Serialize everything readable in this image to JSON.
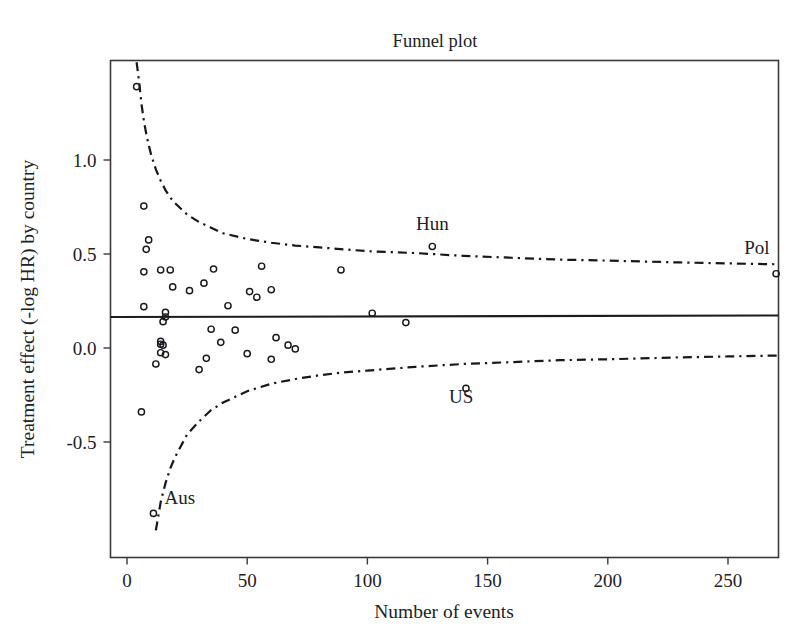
{
  "chart_data": {
    "type": "scatter",
    "title": "Funnel plot",
    "xlabel": "Number of events",
    "ylabel": "Treatment effect (-log HR) by country",
    "xlim": [
      -10,
      273
    ],
    "ylim": [
      -0.97,
      1.5
    ],
    "xticks": [
      0,
      50,
      100,
      150,
      200,
      250
    ],
    "xticklabels": [
      "0",
      "50",
      "100",
      "150",
      "200",
      "250"
    ],
    "yticks": [
      1.0,
      0.5,
      0.0,
      -0.5
    ],
    "yticklabels": [
      "1.0",
      "0.5",
      "0.0",
      "-0.5"
    ],
    "grid": false,
    "legend": null,
    "reference_line": {
      "type": "horizontal",
      "value": 0.17,
      "style": "solid",
      "label": "pooled treatment effect"
    },
    "funnel_limits": {
      "style": "dash-dot",
      "center": 0.17,
      "upper": [
        [
          4,
          1.52
        ],
        [
          5,
          1.42
        ],
        [
          6,
          1.3
        ],
        [
          7,
          1.21
        ],
        [
          8,
          1.14
        ],
        [
          9,
          1.08
        ],
        [
          10,
          1.03
        ],
        [
          12,
          0.95
        ],
        [
          14,
          0.89
        ],
        [
          16,
          0.84
        ],
        [
          18,
          0.8
        ],
        [
          20,
          0.77
        ],
        [
          25,
          0.71
        ],
        [
          30,
          0.67
        ],
        [
          35,
          0.64
        ],
        [
          40,
          0.61
        ],
        [
          50,
          0.58
        ],
        [
          60,
          0.56
        ],
        [
          70,
          0.545
        ],
        [
          80,
          0.535
        ],
        [
          90,
          0.525
        ],
        [
          100,
          0.515
        ],
        [
          120,
          0.505
        ],
        [
          140,
          0.49
        ],
        [
          160,
          0.48
        ],
        [
          180,
          0.47
        ],
        [
          200,
          0.465
        ],
        [
          230,
          0.455
        ],
        [
          250,
          0.45
        ],
        [
          271,
          0.445
        ]
      ],
      "lower": [
        [
          12,
          -0.97
        ],
        [
          14,
          -0.82
        ],
        [
          16,
          -0.72
        ],
        [
          18,
          -0.64
        ],
        [
          20,
          -0.58
        ],
        [
          25,
          -0.46
        ],
        [
          30,
          -0.39
        ],
        [
          35,
          -0.33
        ],
        [
          40,
          -0.29
        ],
        [
          50,
          -0.23
        ],
        [
          60,
          -0.19
        ],
        [
          70,
          -0.165
        ],
        [
          80,
          -0.145
        ],
        [
          90,
          -0.13
        ],
        [
          100,
          -0.12
        ],
        [
          120,
          -0.1
        ],
        [
          140,
          -0.085
        ],
        [
          160,
          -0.075
        ],
        [
          180,
          -0.065
        ],
        [
          200,
          -0.06
        ],
        [
          230,
          -0.05
        ],
        [
          250,
          -0.045
        ],
        [
          271,
          -0.04
        ]
      ]
    },
    "points": [
      {
        "x": 4,
        "y": 1.39
      },
      {
        "x": 7,
        "y": 0.755
      },
      {
        "x": 9,
        "y": 0.575
      },
      {
        "x": 8,
        "y": 0.525
      },
      {
        "x": 14,
        "y": 0.415
      },
      {
        "x": 18,
        "y": 0.415
      },
      {
        "x": 7,
        "y": 0.405
      },
      {
        "x": 36,
        "y": 0.42
      },
      {
        "x": 56,
        "y": 0.435
      },
      {
        "x": 89,
        "y": 0.415
      },
      {
        "x": 127,
        "y": 0.54
      },
      {
        "x": 270,
        "y": 0.395
      },
      {
        "x": 32,
        "y": 0.345
      },
      {
        "x": 19,
        "y": 0.325
      },
      {
        "x": 60,
        "y": 0.31
      },
      {
        "x": 26,
        "y": 0.305
      },
      {
        "x": 51,
        "y": 0.3
      },
      {
        "x": 54,
        "y": 0.27
      },
      {
        "x": 7,
        "y": 0.22
      },
      {
        "x": 42,
        "y": 0.225
      },
      {
        "x": 16,
        "y": 0.19
      },
      {
        "x": 102,
        "y": 0.185
      },
      {
        "x": 16,
        "y": 0.165
      },
      {
        "x": 15,
        "y": 0.14
      },
      {
        "x": 116,
        "y": 0.135
      },
      {
        "x": 35,
        "y": 0.1
      },
      {
        "x": 45,
        "y": 0.095
      },
      {
        "x": 14,
        "y": 0.035
      },
      {
        "x": 14,
        "y": 0.02
      },
      {
        "x": 15,
        "y": 0.015
      },
      {
        "x": 39,
        "y": 0.03
      },
      {
        "x": 62,
        "y": 0.055
      },
      {
        "x": 67,
        "y": 0.015
      },
      {
        "x": 70,
        "y": -0.005
      },
      {
        "x": 14,
        "y": -0.025
      },
      {
        "x": 16,
        "y": -0.035
      },
      {
        "x": 50,
        "y": -0.03
      },
      {
        "x": 12,
        "y": -0.085
      },
      {
        "x": 33,
        "y": -0.055
      },
      {
        "x": 60,
        "y": -0.06
      },
      {
        "x": 30,
        "y": -0.115
      },
      {
        "x": 6,
        "y": -0.34
      },
      {
        "x": 141,
        "y": -0.215
      },
      {
        "x": 11,
        "y": -0.88
      }
    ],
    "annotations": [
      {
        "text": "Hun",
        "x": 127,
        "y": 0.63
      },
      {
        "text": "Pol",
        "x": 262,
        "y": 0.5
      },
      {
        "text": "US",
        "x": 139,
        "y": -0.29
      },
      {
        "text": "Aus",
        "x": 22,
        "y": -0.83
      }
    ]
  },
  "figure": {
    "title": "Funnel plot",
    "axis_titles": {
      "x": "Number of events",
      "y": "Treatment effect (-log HR) by country"
    }
  },
  "colors": {
    "line": "#1c1c1c",
    "point_stroke": "#18181d",
    "axis": "#3a3a3a",
    "text": "#222226",
    "background": "#ffffff"
  }
}
